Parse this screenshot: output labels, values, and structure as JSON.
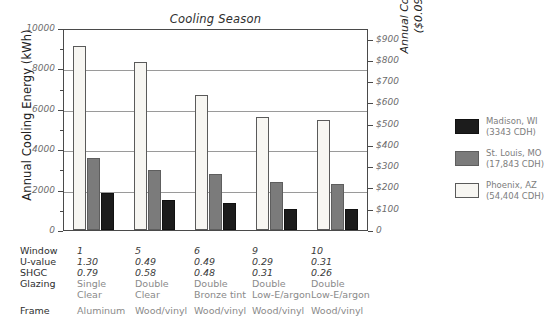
{
  "chart_data": {
    "type": "bar",
    "title": "Cooling Season",
    "xlabel": "",
    "ylabel": "Annual Cooling Energy (kWh)",
    "ylabel_right_line1": "Annual Cooling Fuel Cost",
    "ylabel_right_line2": "($0.095 per kWh)",
    "categories": [
      "1",
      "5",
      "6",
      "9",
      "10"
    ],
    "ylim": [
      0,
      10000
    ],
    "yticks": [
      0,
      2000,
      4000,
      6000,
      8000,
      10000
    ],
    "yticklabels": [
      "0",
      "2000",
      "4000",
      "6000",
      "8000",
      "10000"
    ],
    "y2lim": [
      0,
      950
    ],
    "y2ticks": [
      0,
      100,
      200,
      300,
      400,
      500,
      600,
      700,
      800,
      900
    ],
    "y2ticklabels": [
      "0",
      "$100",
      "$200",
      "$300",
      "$400",
      "$500",
      "$600",
      "$700",
      "$800",
      "$900"
    ],
    "grid": true,
    "legend_position": "right",
    "series": [
      {
        "name": "Madison, WI",
        "sub": "(3343 CDH)",
        "color": "#1c1c1c",
        "values": [
          1830,
          1500,
          1320,
          1050,
          1020
        ]
      },
      {
        "name": "St. Louis, MO",
        "sub": "(17,843 CDH)",
        "color": "#7b7b7b",
        "values": [
          3570,
          2980,
          2780,
          2380,
          2300
        ]
      },
      {
        "name": "Phoenix, AZ",
        "sub": "(54,404 CDH)",
        "color": "#f7f6f2",
        "values": [
          9120,
          8300,
          6700,
          5600,
          5450
        ]
      }
    ]
  },
  "table": {
    "row_labels": [
      "Window",
      "U-value",
      "SHGC",
      "Glazing",
      "Frame"
    ],
    "columns": [
      {
        "window": "1",
        "u_value": "1.30",
        "shgc": "0.79",
        "glazing_line1": "Single",
        "glazing_line2": "Clear",
        "frame": "Aluminum"
      },
      {
        "window": "5",
        "u_value": "0.49",
        "shgc": "0.58",
        "glazing_line1": "Double",
        "glazing_line2": "Clear",
        "frame": "Wood/vinyl"
      },
      {
        "window": "6",
        "u_value": "0.49",
        "shgc": "0.48",
        "glazing_line1": "Double",
        "glazing_line2": "Bronze tint",
        "frame": "Wood/vinyl"
      },
      {
        "window": "9",
        "u_value": "0.29",
        "shgc": "0.31",
        "glazing_line1": "Double",
        "glazing_line2": "Low-E/argon",
        "frame": "Wood/vinyl"
      },
      {
        "window": "10",
        "u_value": "0.31",
        "shgc": "0.26",
        "glazing_line1": "Double",
        "glazing_line2": "Low-E/argon",
        "frame": "Wood/vinyl"
      }
    ]
  }
}
